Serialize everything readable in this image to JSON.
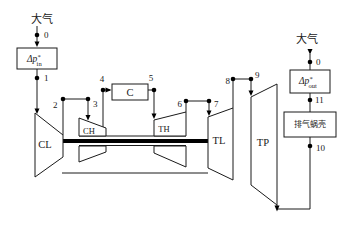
{
  "diagram": {
    "title_implicit": "",
    "atmosphere_left": "大气",
    "atmosphere_right": "大气",
    "inlet_loss": {
      "symbol": "Δp",
      "sup": "*",
      "sub": "in"
    },
    "outlet_loss": {
      "symbol": "Δp",
      "sup": "*",
      "sub": "out"
    },
    "exhaust_volute": "排气蜗壳",
    "components": {
      "lp_compressor": "CL",
      "hp_compressor": "CH",
      "combustor": "C",
      "hp_turbine": "TH",
      "lp_turbine": "TL",
      "power_turbine": "TP"
    },
    "stations": {
      "s0_in": "0",
      "s1": "1",
      "s2": "2",
      "s3": "3",
      "s4": "4",
      "s5": "5",
      "s6": "6",
      "s7": "7",
      "s8": "8",
      "s9": "9",
      "s10": "10",
      "s11": "11",
      "s0_out": "0"
    }
  },
  "colors": {
    "line": "#1a1a1a",
    "background": "#ffffff"
  }
}
